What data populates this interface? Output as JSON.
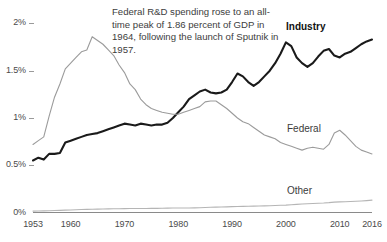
{
  "chart_data": {
    "type": "line",
    "title": "",
    "subtitle": "",
    "xlabel": "",
    "ylabel": "",
    "xlim": [
      1953,
      2016
    ],
    "ylim": [
      0,
      2.1
    ],
    "grid": false,
    "legend_position": "inline-labels",
    "y_tick_labels": [
      "2%",
      "1.5%",
      "1%",
      "0.5%",
      "0%"
    ],
    "y_tick_values": [
      2,
      1.5,
      1,
      0.5,
      0
    ],
    "x_tick_labels": [
      "1953",
      "1960",
      "1970",
      "1980",
      "1990",
      "2000",
      "2010",
      "2016"
    ],
    "x_tick_values": [
      1953,
      1960,
      1970,
      1980,
      1990,
      2000,
      2010,
      2016
    ],
    "annotations": [
      {
        "name": "sputnik-note",
        "text": "Federal R&D spending rose to an all-time peak of 1.86 percent of GDP in 1964, following the launch of Sputnik in 1957."
      }
    ],
    "series": [
      {
        "name": "Industry",
        "label": "Industry",
        "color": "#1a1a1a",
        "width": 2.1,
        "x": [
          1953,
          1954,
          1955,
          1956,
          1957,
          1958,
          1959,
          1960,
          1961,
          1962,
          1963,
          1964,
          1965,
          1966,
          1967,
          1968,
          1969,
          1970,
          1971,
          1972,
          1973,
          1974,
          1975,
          1976,
          1977,
          1978,
          1979,
          1980,
          1981,
          1982,
          1983,
          1984,
          1985,
          1986,
          1987,
          1988,
          1989,
          1990,
          1991,
          1992,
          1993,
          1994,
          1995,
          1996,
          1997,
          1998,
          1999,
          2000,
          2001,
          2002,
          2003,
          2004,
          2005,
          2006,
          2007,
          2008,
          2009,
          2010,
          2011,
          2012,
          2013,
          2014,
          2015,
          2016
        ],
        "values": [
          0.55,
          0.58,
          0.56,
          0.62,
          0.62,
          0.63,
          0.74,
          0.76,
          0.78,
          0.8,
          0.82,
          0.83,
          0.84,
          0.86,
          0.88,
          0.9,
          0.92,
          0.94,
          0.93,
          0.92,
          0.94,
          0.93,
          0.92,
          0.93,
          0.93,
          0.95,
          1.0,
          1.06,
          1.12,
          1.2,
          1.24,
          1.28,
          1.3,
          1.27,
          1.26,
          1.27,
          1.3,
          1.38,
          1.47,
          1.44,
          1.38,
          1.34,
          1.38,
          1.44,
          1.5,
          1.58,
          1.68,
          1.8,
          1.76,
          1.64,
          1.58,
          1.54,
          1.58,
          1.65,
          1.71,
          1.73,
          1.66,
          1.64,
          1.68,
          1.7,
          1.74,
          1.78,
          1.81,
          1.83
        ]
      },
      {
        "name": "Federal",
        "label": "Federal",
        "color": "#9b9b9b",
        "width": 1.1,
        "x": [
          1953,
          1954,
          1955,
          1956,
          1957,
          1958,
          1959,
          1960,
          1961,
          1962,
          1963,
          1964,
          1965,
          1966,
          1967,
          1968,
          1969,
          1970,
          1971,
          1972,
          1973,
          1974,
          1975,
          1976,
          1977,
          1978,
          1979,
          1980,
          1981,
          1982,
          1983,
          1984,
          1985,
          1986,
          1987,
          1988,
          1989,
          1990,
          1991,
          1992,
          1993,
          1994,
          1995,
          1996,
          1997,
          1998,
          1999,
          2000,
          2001,
          2002,
          2003,
          2004,
          2005,
          2006,
          2007,
          2008,
          2009,
          2010,
          2011,
          2012,
          2013,
          2014,
          2015,
          2016
        ],
        "values": [
          0.72,
          0.76,
          0.8,
          1.02,
          1.22,
          1.36,
          1.52,
          1.58,
          1.64,
          1.7,
          1.72,
          1.86,
          1.82,
          1.78,
          1.72,
          1.66,
          1.56,
          1.48,
          1.36,
          1.3,
          1.2,
          1.14,
          1.1,
          1.08,
          1.06,
          1.05,
          1.04,
          1.04,
          1.06,
          1.08,
          1.1,
          1.12,
          1.17,
          1.18,
          1.18,
          1.14,
          1.1,
          1.05,
          1.0,
          0.96,
          0.94,
          0.9,
          0.86,
          0.82,
          0.8,
          0.78,
          0.74,
          0.72,
          0.7,
          0.68,
          0.66,
          0.68,
          0.69,
          0.68,
          0.67,
          0.72,
          0.84,
          0.87,
          0.82,
          0.76,
          0.7,
          0.66,
          0.64,
          0.62
        ]
      },
      {
        "name": "Other",
        "label": "Other",
        "color": "#b5b5b5",
        "width": 1.1,
        "x": [
          1953,
          1954,
          1955,
          1956,
          1957,
          1958,
          1959,
          1960,
          1961,
          1962,
          1963,
          1964,
          1965,
          1966,
          1967,
          1968,
          1969,
          1970,
          1971,
          1972,
          1973,
          1974,
          1975,
          1976,
          1977,
          1978,
          1979,
          1980,
          1981,
          1982,
          1983,
          1984,
          1985,
          1986,
          1987,
          1988,
          1989,
          1990,
          1991,
          1992,
          1993,
          1994,
          1995,
          1996,
          1997,
          1998,
          1999,
          2000,
          2001,
          2002,
          2003,
          2004,
          2005,
          2006,
          2007,
          2008,
          2009,
          2010,
          2011,
          2012,
          2013,
          2014,
          2015,
          2016
        ],
        "values": [
          0.015,
          0.016,
          0.017,
          0.019,
          0.021,
          0.023,
          0.025,
          0.027,
          0.029,
          0.031,
          0.033,
          0.034,
          0.036,
          0.037,
          0.038,
          0.039,
          0.04,
          0.041,
          0.042,
          0.042,
          0.043,
          0.043,
          0.044,
          0.044,
          0.045,
          0.046,
          0.047,
          0.048,
          0.047,
          0.048,
          0.049,
          0.051,
          0.053,
          0.055,
          0.057,
          0.058,
          0.06,
          0.062,
          0.064,
          0.065,
          0.066,
          0.067,
          0.069,
          0.07,
          0.072,
          0.074,
          0.076,
          0.078,
          0.082,
          0.086,
          0.09,
          0.093,
          0.095,
          0.098,
          0.1,
          0.104,
          0.11,
          0.112,
          0.114,
          0.116,
          0.119,
          0.122,
          0.126,
          0.131
        ]
      }
    ]
  }
}
